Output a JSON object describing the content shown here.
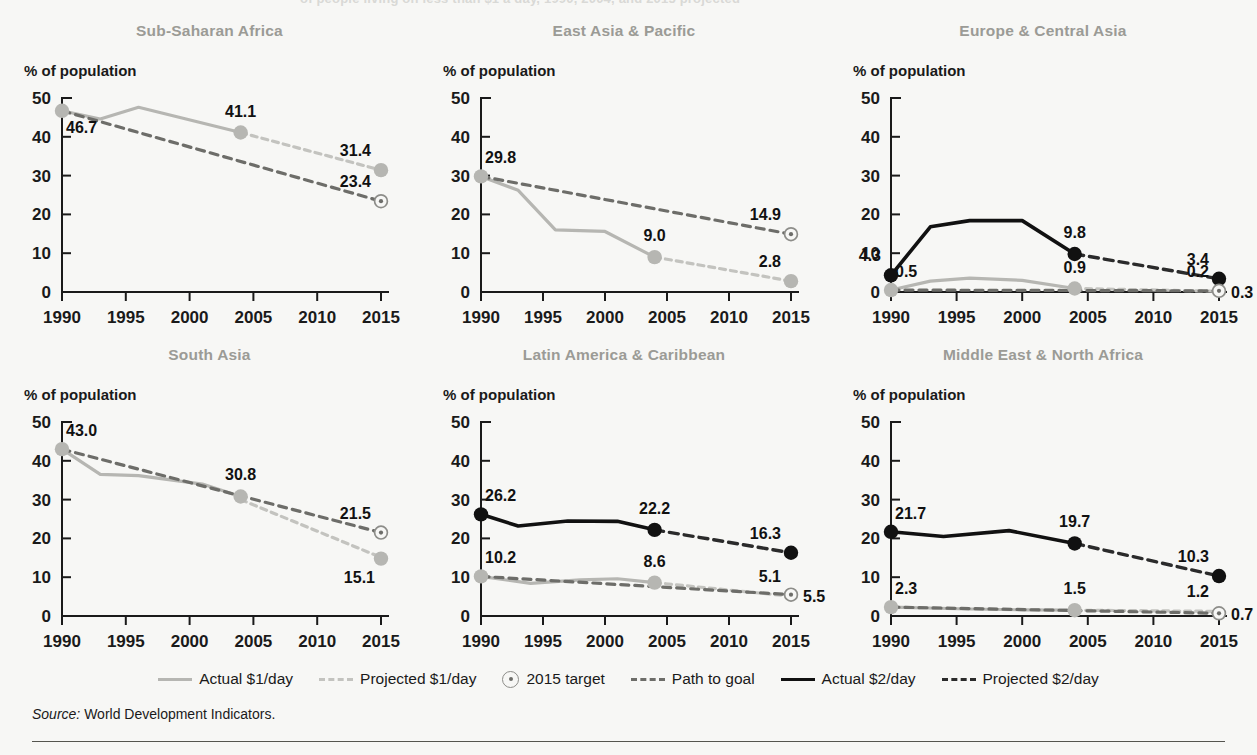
{
  "page": {
    "clipped_header_text": "of people living on less than $1 a day, 1990, 2004, and 2015 projected",
    "source_prefix": "Source:",
    "source_text": "World Development Indicators."
  },
  "axis": {
    "ylabel": "% of population",
    "yticks": [
      0,
      10,
      20,
      30,
      40,
      50
    ],
    "xticks": [
      1990,
      1995,
      2000,
      2005,
      2010,
      2015
    ],
    "ylim": [
      0,
      50
    ],
    "xlim": [
      1990,
      2015
    ],
    "grid": false
  },
  "legend": {
    "position": "bottom-center",
    "items": [
      {
        "label": "Actual $1/day",
        "style": "solid-gray",
        "color": "#b6b6b2"
      },
      {
        "label": "Projected $1/day",
        "style": "dash-gray",
        "color": "#c3c3bf"
      },
      {
        "label": "2015 target",
        "style": "target-marker",
        "color": "#8d8d89"
      },
      {
        "label": "Path to goal",
        "style": "dash-dark",
        "color": "#6d6d69"
      },
      {
        "label": "Actual $2/day",
        "style": "solid-black",
        "color": "#111111"
      },
      {
        "label": "Projected $2/day",
        "style": "dash-black",
        "color": "#2b2b2b"
      }
    ]
  },
  "colors": {
    "title": "#9b9b96",
    "background": "#f7f7f5",
    "actual_1day": "#b6b6b2",
    "projected_1day": "#c3c3bf",
    "path_to_goal": "#6d6d69",
    "actual_2day": "#111111",
    "projected_2day": "#2b2b2b",
    "target_marker": "#8d8d89",
    "axis": "#1a1a1a"
  },
  "chart_data": [
    {
      "type": "line",
      "title": "Sub-Saharan Africa",
      "xlabel": "",
      "ylabel": "% of population",
      "xlim": [
        1990,
        2015
      ],
      "ylim": [
        0,
        50
      ],
      "series": [
        {
          "name": "Actual $1/day",
          "style": "solid-gray",
          "x": [
            1990,
            1993,
            1996,
            2004
          ],
          "values": [
            46.7,
            44.6,
            47.6,
            41.1
          ]
        },
        {
          "name": "Projected $1/day",
          "style": "dash-gray",
          "x": [
            2004,
            2015
          ],
          "values": [
            41.1,
            31.4
          ]
        },
        {
          "name": "Path to goal",
          "style": "dash-dark",
          "x": [
            1990,
            2015
          ],
          "values": [
            46.7,
            23.4
          ]
        }
      ],
      "points": [
        {
          "label": "46.7",
          "x": 1990,
          "y": 46.7,
          "marker": "dot-gray",
          "anchor": "below-right"
        },
        {
          "label": "41.1",
          "x": 2004,
          "y": 41.1,
          "marker": "dot-gray",
          "anchor": "above"
        },
        {
          "label": "31.4",
          "x": 2015,
          "y": 31.4,
          "marker": "dot-gray",
          "anchor": "above-left"
        },
        {
          "label": "23.4",
          "x": 2015,
          "y": 23.4,
          "marker": "target",
          "anchor": "above-left"
        }
      ]
    },
    {
      "type": "line",
      "title": "East Asia & Pacific",
      "xlabel": "",
      "ylabel": "% of population",
      "xlim": [
        1990,
        2015
      ],
      "ylim": [
        0,
        50
      ],
      "series": [
        {
          "name": "Actual $1/day",
          "style": "solid-gray",
          "x": [
            1990,
            1993,
            1996,
            2000,
            2004
          ],
          "values": [
            29.8,
            26.2,
            16.0,
            15.6,
            9.0
          ]
        },
        {
          "name": "Projected $1/day",
          "style": "dash-gray",
          "x": [
            2004,
            2015
          ],
          "values": [
            9.0,
            2.8
          ]
        },
        {
          "name": "Path to goal",
          "style": "dash-dark",
          "x": [
            1990,
            2015
          ],
          "values": [
            29.8,
            14.9
          ]
        }
      ],
      "points": [
        {
          "label": "29.8",
          "x": 1990,
          "y": 29.8,
          "marker": "dot-gray",
          "anchor": "above-right"
        },
        {
          "label": "9.0",
          "x": 2004,
          "y": 9.0,
          "marker": "dot-gray",
          "anchor": "above"
        },
        {
          "label": "14.9",
          "x": 2015,
          "y": 14.9,
          "marker": "target",
          "anchor": "above-left"
        },
        {
          "label": "2.8",
          "x": 2015,
          "y": 2.8,
          "marker": "dot-gray",
          "anchor": "above-left"
        }
      ]
    },
    {
      "type": "line",
      "title": "Europe & Central Asia",
      "xlabel": "",
      "ylabel": "% of population",
      "xlim": [
        1990,
        2015
      ],
      "ylim": [
        0,
        50
      ],
      "series": [
        {
          "name": "Actual $2/day",
          "style": "solid-black",
          "x": [
            1990,
            1993,
            1996,
            2000,
            2004
          ],
          "values": [
            4.3,
            16.8,
            18.4,
            18.4,
            9.8
          ]
        },
        {
          "name": "Projected $2/day",
          "style": "dash-black",
          "x": [
            2004,
            2015
          ],
          "values": [
            9.8,
            3.4
          ]
        },
        {
          "name": "Actual $1/day",
          "style": "solid-gray",
          "x": [
            1990,
            1993,
            1996,
            2000,
            2004
          ],
          "values": [
            0.5,
            2.8,
            3.6,
            3.0,
            0.9
          ]
        },
        {
          "name": "Projected $1/day",
          "style": "dash-gray",
          "x": [
            2004,
            2015
          ],
          "values": [
            0.9,
            0.2
          ]
        },
        {
          "name": "Path to goal",
          "style": "dash-dark",
          "x": [
            1990,
            2015
          ],
          "values": [
            0.5,
            0.3
          ]
        }
      ],
      "points": [
        {
          "label": "4.3",
          "x": 1990,
          "y": 4.3,
          "marker": "dot-black",
          "anchor": "above-left"
        },
        {
          "label": "0.5",
          "x": 1990,
          "y": 0.5,
          "marker": "dot-gray",
          "anchor": "above-right"
        },
        {
          "label": "9.8",
          "x": 2004,
          "y": 9.8,
          "marker": "dot-black",
          "anchor": "above"
        },
        {
          "label": "0.9",
          "x": 2004,
          "y": 0.9,
          "marker": "dot-gray",
          "anchor": "above"
        },
        {
          "label": "3.4",
          "x": 2015,
          "y": 3.4,
          "marker": "dot-black",
          "anchor": "above-left"
        },
        {
          "label": "0.2",
          "x": 2015,
          "y": 0.2,
          "marker": "none",
          "anchor": "above-left"
        },
        {
          "label": "0.3",
          "x": 2015,
          "y": 0.3,
          "marker": "target",
          "anchor": "right"
        }
      ]
    },
    {
      "type": "line",
      "title": "South Asia",
      "xlabel": "",
      "ylabel": "% of population",
      "xlim": [
        1990,
        2015
      ],
      "ylim": [
        0,
        50
      ],
      "series": [
        {
          "name": "Actual $1/day",
          "style": "solid-gray",
          "x": [
            1990,
            1993,
            1996,
            2001,
            2004
          ],
          "values": [
            43.0,
            36.5,
            36.2,
            34.0,
            30.8
          ]
        },
        {
          "name": "Projected $1/day",
          "style": "dash-gray",
          "x": [
            2004,
            2015
          ],
          "values": [
            30.0,
            15.1
          ]
        },
        {
          "name": "Path to goal",
          "style": "dash-dark",
          "x": [
            1990,
            2015
          ],
          "values": [
            43.0,
            21.5
          ]
        }
      ],
      "points": [
        {
          "label": "43.0",
          "x": 1990,
          "y": 43.0,
          "marker": "dot-gray",
          "anchor": "above-right"
        },
        {
          "label": "30.8",
          "x": 2004,
          "y": 30.8,
          "marker": "dot-gray",
          "anchor": "above"
        },
        {
          "label": "21.5",
          "x": 2015,
          "y": 21.5,
          "marker": "target",
          "anchor": "above-left"
        },
        {
          "label": "15.1",
          "x": 2015,
          "y": 14.8,
          "marker": "dot-gray",
          "anchor": "below-left"
        }
      ]
    },
    {
      "type": "line",
      "title": "Latin America & Caribbean",
      "xlabel": "",
      "ylabel": "% of population",
      "xlim": [
        1990,
        2015
      ],
      "ylim": [
        0,
        50
      ],
      "series": [
        {
          "name": "Actual $2/day",
          "style": "solid-black",
          "x": [
            1990,
            1993,
            1997,
            2001,
            2004
          ],
          "values": [
            26.2,
            23.2,
            24.5,
            24.4,
            22.2
          ]
        },
        {
          "name": "Projected $2/day",
          "style": "dash-black",
          "x": [
            2004,
            2015
          ],
          "values": [
            22.2,
            16.3
          ]
        },
        {
          "name": "Actual $1/day",
          "style": "solid-gray",
          "x": [
            1990,
            1994,
            1998,
            2001,
            2004
          ],
          "values": [
            10.2,
            8.4,
            9.3,
            9.6,
            8.6
          ]
        },
        {
          "name": "Projected $1/day",
          "style": "dash-gray",
          "x": [
            2004,
            2015
          ],
          "values": [
            8.6,
            5.1
          ]
        },
        {
          "name": "Path to goal",
          "style": "dash-dark",
          "x": [
            1990,
            2015
          ],
          "values": [
            10.2,
            5.5
          ]
        }
      ],
      "points": [
        {
          "label": "26.2",
          "x": 1990,
          "y": 26.2,
          "marker": "dot-black",
          "anchor": "above-right"
        },
        {
          "label": "10.2",
          "x": 1990,
          "y": 10.2,
          "marker": "dot-gray",
          "anchor": "above-right"
        },
        {
          "label": "22.2",
          "x": 2004,
          "y": 22.2,
          "marker": "dot-black",
          "anchor": "above"
        },
        {
          "label": "8.6",
          "x": 2004,
          "y": 8.6,
          "marker": "dot-gray",
          "anchor": "above"
        },
        {
          "label": "16.3",
          "x": 2015,
          "y": 16.3,
          "marker": "dot-black",
          "anchor": "above-left"
        },
        {
          "label": "5.1",
          "x": 2015,
          "y": 5.1,
          "marker": "none",
          "anchor": "above-left"
        },
        {
          "label": "5.5",
          "x": 2015,
          "y": 5.5,
          "marker": "target",
          "anchor": "right"
        }
      ]
    },
    {
      "type": "line",
      "title": "Middle East & North Africa",
      "xlabel": "",
      "ylabel": "% of population",
      "xlim": [
        1990,
        2015
      ],
      "ylim": [
        0,
        50
      ],
      "series": [
        {
          "name": "Actual $2/day",
          "style": "solid-black",
          "x": [
            1990,
            1994,
            1999,
            2004
          ],
          "values": [
            21.7,
            20.5,
            22.0,
            18.7
          ]
        },
        {
          "name": "Projected $2/day",
          "style": "dash-black",
          "x": [
            2004,
            2015
          ],
          "values": [
            18.7,
            10.3
          ]
        },
        {
          "name": "Actual $1/day",
          "style": "solid-gray",
          "x": [
            1990,
            1996,
            2000,
            2004
          ],
          "values": [
            2.3,
            1.8,
            1.6,
            1.5
          ]
        },
        {
          "name": "Projected $1/day",
          "style": "dash-gray",
          "x": [
            2004,
            2015
          ],
          "values": [
            1.5,
            1.2
          ]
        },
        {
          "name": "Path to goal",
          "style": "dash-dark",
          "x": [
            1990,
            2015
          ],
          "values": [
            2.3,
            0.7
          ]
        }
      ],
      "points": [
        {
          "label": "21.7",
          "x": 1990,
          "y": 21.7,
          "marker": "dot-black",
          "anchor": "above-right"
        },
        {
          "label": "2.3",
          "x": 1990,
          "y": 2.3,
          "marker": "dot-gray",
          "anchor": "above-right"
        },
        {
          "label": "19.7",
          "x": 2004,
          "y": 18.7,
          "marker": "dot-black",
          "anchor": "above"
        },
        {
          "label": "1.5",
          "x": 2004,
          "y": 1.5,
          "marker": "dot-gray",
          "anchor": "above"
        },
        {
          "label": "10.3",
          "x": 2015,
          "y": 10.3,
          "marker": "dot-black",
          "anchor": "above-left"
        },
        {
          "label": "1.2",
          "x": 2015,
          "y": 1.2,
          "marker": "none",
          "anchor": "above-left"
        },
        {
          "label": "0.7",
          "x": 2015,
          "y": 0.7,
          "marker": "target",
          "anchor": "right"
        }
      ]
    }
  ]
}
